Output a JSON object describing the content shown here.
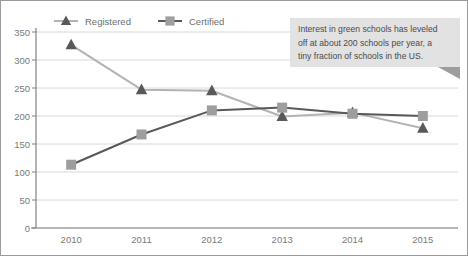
{
  "chart_data": {
    "type": "line",
    "title": "",
    "subtitle": "",
    "xlabel": "",
    "ylabel": "",
    "categories": [
      "2010",
      "2011",
      "2012",
      "2013",
      "2014",
      "2015"
    ],
    "series": [
      {
        "name": "Registered",
        "marker": "triangle",
        "color": "#595959",
        "line_color": "#b3b3b3",
        "values": [
          327,
          247,
          245,
          199,
          206,
          178
        ]
      },
      {
        "name": "Certified",
        "marker": "square",
        "color": "#9e9e9e",
        "line_color": "#595959",
        "values": [
          113,
          167,
          210,
          215,
          204,
          200
        ]
      }
    ],
    "ylim": [
      0,
      350
    ],
    "yticks": [
      0,
      50,
      100,
      150,
      200,
      250,
      300,
      350
    ],
    "ytick_labels": [
      "0",
      "50",
      "100",
      "150",
      "200",
      "250",
      "300",
      "350"
    ],
    "grid": true,
    "legend_position": "top-left"
  },
  "legend": {
    "items": [
      {
        "label": "Registered",
        "marker": "triangle-icon"
      },
      {
        "label": "Certified",
        "marker": "square-icon"
      }
    ]
  },
  "callout": {
    "lines": [
      "Interest in green schools has leveled",
      "off at about 200 schools per year, a",
      "tiny fraction of schools in the US."
    ],
    "background": "#e2e2e2",
    "tail": "callout-tail-icon"
  },
  "axes": {
    "x_labels": [
      "2010",
      "2011",
      "2012",
      "2013",
      "2014",
      "2015"
    ],
    "y_labels": [
      "350",
      "300",
      "250",
      "200",
      "150",
      "100",
      "50",
      "0"
    ]
  },
  "colors": {
    "grid": "#d8d8d8",
    "axis": "#808080",
    "border": "#9a9a9a",
    "registered_line": "#b3b3b3",
    "registered_marker": "#595959",
    "certified_line": "#595959",
    "certified_marker": "#9e9e9e"
  }
}
